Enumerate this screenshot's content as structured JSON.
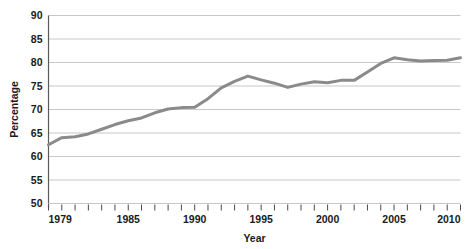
{
  "chart_data": {
    "type": "line",
    "title": "",
    "xlabel": "Year",
    "ylabel": "Percentage",
    "xlim": [
      1979,
      2010
    ],
    "ylim": [
      50,
      90
    ],
    "grid": true,
    "legend": false,
    "legend_position": "none",
    "line_color": "#8a8a8a",
    "gridline_color": "#c8c8c8",
    "axis_color": "#5a5a5a",
    "background_color": "#ffffff",
    "y_ticks": [
      50,
      55,
      60,
      65,
      70,
      75,
      80,
      85,
      90
    ],
    "y_tick_labels": [
      "50",
      "55",
      "60",
      "65",
      "70",
      "75",
      "80",
      "85",
      "90"
    ],
    "x_ticks": [
      1979,
      1980,
      1981,
      1982,
      1983,
      1984,
      1985,
      1986,
      1987,
      1988,
      1989,
      1990,
      1991,
      1992,
      1993,
      1994,
      1995,
      1996,
      1997,
      1998,
      1999,
      2000,
      2001,
      2002,
      2003,
      2004,
      2005,
      2006,
      2007,
      2008,
      2009,
      2010
    ],
    "x_tick_labels": [
      {
        "value": 1979,
        "label": "1979"
      },
      {
        "value": 1985,
        "label": "1985"
      },
      {
        "value": 1990,
        "label": "1990"
      },
      {
        "value": 1995,
        "label": "1995"
      },
      {
        "value": 2000,
        "label": "2000"
      },
      {
        "value": 2005,
        "label": "2005"
      },
      {
        "value": 2010,
        "label": "2010"
      }
    ],
    "x": [
      1979,
      1980,
      1981,
      1982,
      1983,
      1984,
      1985,
      1986,
      1987,
      1988,
      1989,
      1990,
      1991,
      1992,
      1993,
      1994,
      1995,
      1996,
      1997,
      1998,
      1999,
      2000,
      2001,
      2002,
      2003,
      2004,
      2005,
      2006,
      2007,
      2008,
      2009,
      2010
    ],
    "values": [
      62.5,
      64.0,
      64.2,
      64.8,
      65.8,
      66.8,
      67.6,
      68.2,
      69.3,
      70.1,
      70.4,
      70.5,
      72.3,
      74.6,
      76.0,
      77.1,
      76.3,
      75.6,
      74.7,
      75.4,
      75.9,
      75.7,
      76.2,
      76.2,
      78.0,
      79.8,
      81.0,
      80.6,
      80.3,
      80.4,
      80.5,
      81.0
    ],
    "series": [
      {
        "name": "Percentage",
        "color": "#8a8a8a",
        "values": [
          62.5,
          64.0,
          64.2,
          64.8,
          65.8,
          66.8,
          67.6,
          68.2,
          69.3,
          70.1,
          70.4,
          70.5,
          72.3,
          74.6,
          76.0,
          77.1,
          76.3,
          75.6,
          74.7,
          75.4,
          75.9,
          75.7,
          76.2,
          76.2,
          78.0,
          79.8,
          81.0,
          80.6,
          80.3,
          80.4,
          80.5,
          81.0
        ]
      }
    ]
  }
}
